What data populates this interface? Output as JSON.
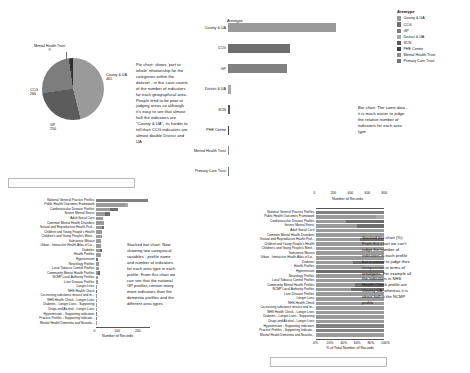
{
  "legend": {
    "title": "Areatype",
    "items": [
      {
        "label": "County & UA",
        "color": "#9a9a9a"
      },
      {
        "label": "CCG",
        "color": "#6e6e6e"
      },
      {
        "label": "GP",
        "color": "#808080"
      },
      {
        "label": "District & UA",
        "color": "#aaaaaa"
      },
      {
        "label": "SCN",
        "color": "#5a5a5a"
      },
      {
        "label": "PHE Centre",
        "color": "#3f3f3f"
      },
      {
        "label": "Mental Health Trust",
        "color": "#8c8c8c"
      },
      {
        "label": "Primary Care Trust",
        "color": "#757575"
      }
    ]
  },
  "pie": {
    "note": "Pie chart: shows 'part to whole' relationship for the categories within the dataset - in this case counts of the number of indicators for each geographical area. People tend to be poor at judging areas so although it's easy to see that almost half the indicators are \"County & UA\", its harder to tell than CCG indicators are almost double District and UA",
    "chart_data": {
      "type": "pie",
      "title": "",
      "labels": [
        "County & UA",
        "CCG",
        "GP",
        "District & UA",
        "Mental Health Trust"
      ],
      "values": [
        461,
        266,
        250,
        11,
        9
      ],
      "legend_position": "annotated"
    },
    "labels": [
      {
        "name": "County & UA",
        "value": "461"
      },
      {
        "name": "CCG",
        "value": "266"
      },
      {
        "name": "GP",
        "value": "250"
      },
      {
        "name": "Mental Health Trust",
        "value": "9"
      }
    ]
  },
  "bar": {
    "note": "Bar chart: The same data - it is much easier to judge the relative number of indicators for each area type",
    "chart_data": {
      "type": "bar",
      "orientation": "horizontal",
      "title": "Areatype",
      "categories": [
        "County & UA",
        "CCG",
        "GP",
        "District & UA",
        "SCN",
        "PHE Centre",
        "Mental Health Trust",
        "Primary Care Trust"
      ],
      "values": [
        461,
        266,
        250,
        11,
        9,
        6,
        2,
        1
      ],
      "xlabel": "",
      "ylabel": "Areatype",
      "xlim": [
        0,
        470
      ],
      "grid": false
    }
  },
  "stacked_left": {
    "note": "Stacked bar chart: Now showing two categorical variables - profile name and number of indicators for each area type in each profile. From this chart we can see that the national GP profiles contain many more indicators than the dementia profiles and the different area types",
    "chart_data": {
      "type": "bar",
      "stacked": true,
      "orientation": "horizontal",
      "xlabel": "Number of Records",
      "ylabel": "",
      "xlim": [
        0,
        260
      ],
      "ticks": [
        "0",
        "100",
        "200"
      ],
      "categories": [
        "National General Practice Profiles",
        "Public Health Outcomes Framework",
        "Cardiovascular Disease Profiles",
        "Severe Mental Illness",
        "Adult Social Care",
        "Common Mental Health Disorders",
        "Sexual and Reproductive Health Prof...",
        "Children and Young People's Health",
        "Children's and Young People's Ment...",
        "Substance Misuse",
        "Urban - Interactive Health Atlas of Lo...",
        "Diabetes",
        "Health Profiles",
        "Hypertension",
        "Neurology Profiles",
        "Local Tobacco Control Profiles",
        "Community Mental Health Profiles",
        "NCMP Local Authority Profiles",
        "Liver Disease Profiles",
        "Longer Lives",
        "NHS Health Check",
        "Co-existing substance misuse and m...",
        "NHS Health Check - Longer Lives",
        "Diabetes - Longer Lives - Supporting",
        "Drugs and Alcohol - Longer Lives",
        "Hypertension - Supporting indicators",
        "Practice Profiles - Supporting Indicato...",
        "Mental Health Dementia and Neurolo..."
      ],
      "series": [
        {
          "name": "County & UA",
          "values": [
            0,
            142,
            66,
            44,
            33,
            37,
            30,
            30,
            28,
            24,
            25,
            20,
            18,
            0,
            15,
            14,
            12,
            10,
            9,
            7,
            0,
            6,
            4,
            3,
            3,
            0,
            0,
            2
          ]
        },
        {
          "name": "CCG",
          "values": [
            0,
            0,
            42,
            22,
            0,
            0,
            10,
            0,
            0,
            0,
            0,
            9,
            0,
            8,
            0,
            0,
            7,
            0,
            0,
            0,
            5,
            0,
            0,
            0,
            0,
            0,
            0,
            0
          ]
        },
        {
          "name": "GP",
          "values": [
            248,
            0,
            0,
            0,
            0,
            0,
            0,
            0,
            0,
            0,
            0,
            0,
            0,
            0,
            0,
            0,
            0,
            0,
            0,
            0,
            0,
            0,
            0,
            0,
            0,
            2,
            2,
            0
          ]
        },
        {
          "name": "District & UA",
          "values": [
            0,
            10,
            0,
            0,
            0,
            0,
            0,
            0,
            0,
            0,
            0,
            0,
            4,
            0,
            0,
            0,
            0,
            0,
            0,
            0,
            0,
            0,
            0,
            0,
            0,
            0,
            0,
            0
          ]
        }
      ]
    }
  },
  "stacked_right": {
    "note": "Stacked bar chart (%): From this chart we can't judge the number of indicators in each profile but is easier to judge their composition in terms of areatypes. For example all the indicators in NHS Health Check profile are County UA, whereas it is about half in the NCMP profile",
    "chart_data": {
      "type": "bar",
      "stacked": true,
      "normalized": true,
      "orientation": "horizontal",
      "xlabel_bottom": "% of Total Number of Records",
      "xlabel_top": "Number of Records",
      "ticks_bottom": [
        "0%",
        "20%",
        "40%",
        "60%",
        "80%",
        "100%"
      ],
      "ticks_top": [
        "0",
        "200",
        "400",
        "600",
        "800"
      ],
      "categories": [
        "National General Practice Profiles",
        "Public Health Outcomes Framework",
        "Cardiovascular Disease Profiles",
        "Severe Mental Illness",
        "Adult Social Care",
        "Common Mental Health Disorders",
        "Sexual and Reproductive Health Prof...",
        "Children and Young People's Health",
        "Children's and Young People's Ment...",
        "Substance Misuse",
        "Urban - Interactive Health Atlas of Lo...",
        "Diabetes",
        "Health Profiles",
        "Hypertension",
        "Neurology Profiles",
        "Local Tobacco Control Profiles",
        "Community Mental Health Profiles",
        "NCMP Local Authority Profiles",
        "Liver Disease Profiles",
        "Longer Lives",
        "NHS Health Check",
        "Co-existing substance misuse and m...",
        "NHS Health Check - Longer Lives",
        "Diabetes - Longer Lives - Supporting",
        "Drugs and Alcohol - Longer Lives",
        "Hypertension - Supporting indicators",
        "Practice Profiles - Supporting Indicato...",
        "Mental Health Dementia and Neurolo..."
      ],
      "series": [
        {
          "name": "County & UA",
          "percent": [
            0,
            88,
            44,
            60,
            100,
            100,
            64,
            100,
            100,
            100,
            100,
            55,
            72,
            0,
            100,
            100,
            58,
            52,
            100,
            100,
            100,
            100,
            100,
            100,
            100,
            0,
            0,
            100
          ]
        },
        {
          "name": "CCG",
          "percent": [
            0,
            0,
            56,
            40,
            0,
            0,
            36,
            0,
            0,
            0,
            0,
            45,
            0,
            100,
            0,
            0,
            42,
            48,
            0,
            0,
            0,
            0,
            0,
            0,
            0,
            0,
            0,
            0
          ]
        },
        {
          "name": "GP",
          "percent": [
            100,
            0,
            0,
            0,
            0,
            0,
            0,
            0,
            0,
            0,
            0,
            0,
            0,
            0,
            0,
            0,
            0,
            0,
            0,
            0,
            0,
            0,
            0,
            0,
            0,
            100,
            100,
            0
          ]
        },
        {
          "name": "District & UA",
          "percent": [
            0,
            12,
            0,
            0,
            0,
            0,
            0,
            0,
            0,
            0,
            0,
            0,
            28,
            0,
            0,
            0,
            0,
            0,
            0,
            0,
            0,
            0,
            0,
            0,
            0,
            0,
            0,
            0
          ]
        }
      ]
    }
  }
}
